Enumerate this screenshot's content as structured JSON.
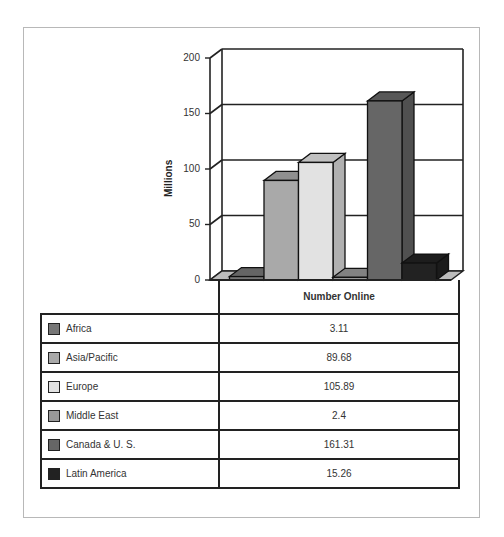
{
  "chart_data": {
    "type": "bar",
    "style": "3d-column",
    "title": "",
    "xlabel": "",
    "ylabel": "Millions",
    "ylim": [
      0,
      200
    ],
    "yticks": [
      0,
      50,
      100,
      150,
      200
    ],
    "grid": true,
    "legend_position": "data-table-below",
    "table_header": "Number Online",
    "categories": [
      "Africa",
      "Asia/Pacific",
      "Europe",
      "Middle East",
      "Canada & U. S.",
      "Latin America"
    ],
    "values": [
      3.11,
      89.68,
      105.89,
      2.4,
      161.31,
      15.26
    ],
    "series": [
      {
        "name": "Africa",
        "value": 3.11,
        "color": "#777777"
      },
      {
        "name": "Asia/Pacific",
        "value": 89.68,
        "color": "#a9a9a9"
      },
      {
        "name": "Europe",
        "value": 105.89,
        "color": "#e2e2e2"
      },
      {
        "name": "Middle East",
        "value": 2.4,
        "color": "#999999"
      },
      {
        "name": "Canada & U. S.",
        "value": 161.31,
        "color": "#666666"
      },
      {
        "name": "Latin America",
        "value": 15.26,
        "color": "#222222"
      }
    ]
  },
  "axis": {
    "ylabel": "Millions",
    "ticks": [
      "200",
      "150",
      "100",
      "50",
      "0"
    ]
  },
  "table": {
    "header": "Number Online",
    "rows": [
      {
        "label": "Africa",
        "value": "3.11"
      },
      {
        "label": "Asia/Pacific",
        "value": "89.68"
      },
      {
        "label": "Europe",
        "value": "105.89"
      },
      {
        "label": "Middle East",
        "value": "2.4"
      },
      {
        "label": "Canada & U. S.",
        "value": "161.31"
      },
      {
        "label": "Latin America",
        "value": "15.26"
      }
    ]
  }
}
